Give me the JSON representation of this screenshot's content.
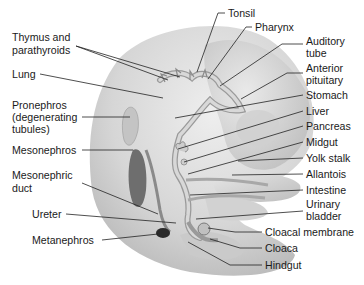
{
  "diagram": {
    "colors": {
      "background": "#ffffff",
      "embryo_body": "#d9d9d9",
      "embryo_shadow": "#bdbdbd",
      "gut_tube": "#c8c8c8",
      "gut_outline": "#9a9a9a",
      "organ_dark": "#6e6e6e",
      "metanephros": "#2a2a2a",
      "label_text": "#1a1a1a",
      "leader_line": "#222222"
    },
    "labels_left": [
      {
        "id": "thymus",
        "lines": [
          "Thymus and",
          "parathyroids"
        ]
      },
      {
        "id": "lung",
        "lines": [
          "Lung"
        ]
      },
      {
        "id": "pronephros",
        "lines": [
          "Pronephros",
          "(degenerating",
          "tubules)"
        ]
      },
      {
        "id": "mesonephros",
        "lines": [
          "Mesonephros"
        ]
      },
      {
        "id": "mesonephric_duct",
        "lines": [
          "Mesonephric",
          "duct"
        ]
      },
      {
        "id": "ureter",
        "lines": [
          "Ureter"
        ]
      },
      {
        "id": "metanephros",
        "lines": [
          "Metanephros"
        ]
      }
    ],
    "labels_top": [
      {
        "id": "tonsil",
        "lines": [
          "Tonsil"
        ]
      },
      {
        "id": "pharynx",
        "lines": [
          "Pharynx"
        ]
      }
    ],
    "labels_right": [
      {
        "id": "auditory_tube",
        "lines": [
          "Auditory",
          "tube"
        ]
      },
      {
        "id": "anterior_pituitary",
        "lines": [
          "Anterior",
          "pituitary"
        ]
      },
      {
        "id": "stomach",
        "lines": [
          "Stomach"
        ]
      },
      {
        "id": "liver",
        "lines": [
          "Liver"
        ]
      },
      {
        "id": "pancreas",
        "lines": [
          "Pancreas"
        ]
      },
      {
        "id": "midgut",
        "lines": [
          "Midgut"
        ]
      },
      {
        "id": "yolk_stalk",
        "lines": [
          "Yolk stalk"
        ]
      },
      {
        "id": "allantois",
        "lines": [
          "Allantois"
        ]
      },
      {
        "id": "intestine",
        "lines": [
          "Intestine"
        ]
      },
      {
        "id": "urinary_bladder",
        "lines": [
          "Urinary",
          "bladder"
        ]
      },
      {
        "id": "cloacal_membrane",
        "lines": [
          "Cloacal membrane"
        ]
      },
      {
        "id": "cloaca",
        "lines": [
          "Cloaca"
        ]
      },
      {
        "id": "hindgut",
        "lines": [
          "Hindgut"
        ]
      }
    ]
  }
}
